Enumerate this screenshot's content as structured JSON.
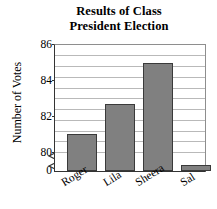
{
  "chart_data": {
    "type": "bar",
    "title": "Results of Class President Election",
    "title_line1": "Results of Class",
    "title_line2": "President Election",
    "xlabel": "",
    "ylabel": "Number of Votes",
    "categories": [
      "Roger",
      "Lila",
      "Sheera",
      "Sal"
    ],
    "values": [
      81.5,
      83,
      85,
      80
    ],
    "ylim": [
      80,
      86
    ],
    "yticks": [
      80,
      82,
      84,
      86
    ],
    "ytick_labels": [
      "80",
      "82",
      "84",
      "86"
    ],
    "zero_label": "0",
    "axis_break": true,
    "grid": true,
    "grid_step": 0.5,
    "legend": "none",
    "bar_color": "#808080",
    "bar_border_color": "#3a3a3a",
    "grid_color": "#b9b9b9",
    "axis_color": "#333333",
    "background": "#ffffff"
  }
}
